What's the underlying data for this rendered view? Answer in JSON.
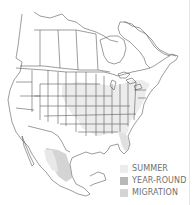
{
  "map": {
    "region": "North America",
    "colors": {
      "land": "#ffffff",
      "border": "#5a5a5a",
      "summer": "#ececec",
      "year_round": "#b8b8b8",
      "migration": "#d4d4d4"
    }
  },
  "legend": {
    "items": [
      {
        "label": "SUMMER",
        "color": "#ececec"
      },
      {
        "label": "YEAR-ROUND",
        "color": "#b8b8b8"
      },
      {
        "label": "MIGRATION",
        "color": "#d4d4d4"
      }
    ]
  }
}
